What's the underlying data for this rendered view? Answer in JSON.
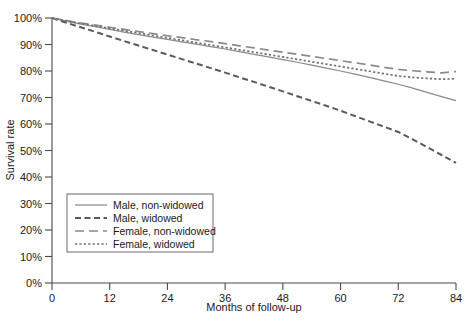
{
  "chart_data": {
    "type": "line",
    "title": "",
    "xlabel": "Months of follow-up",
    "ylabel": "Survival rate",
    "xlim": [
      0,
      84
    ],
    "ylim": [
      0,
      100
    ],
    "grid": false,
    "legend_position": "lower-left",
    "xticks": [
      0,
      12,
      24,
      36,
      48,
      60,
      72,
      84
    ],
    "xtick_labels": [
      "0",
      "12",
      "24",
      "36",
      "48",
      "60",
      "72",
      "84"
    ],
    "yticks": [
      0,
      10,
      20,
      30,
      40,
      50,
      60,
      70,
      80,
      90,
      100
    ],
    "ytick_labels": [
      "0%",
      "10%",
      "20%",
      "30%",
      "40%",
      "50%",
      "60%",
      "70%",
      "80%",
      "90%",
      "100%"
    ],
    "x": [
      0,
      3,
      6,
      9,
      12,
      15,
      18,
      21,
      24,
      27,
      30,
      33,
      36,
      39,
      42,
      45,
      48,
      51,
      54,
      57,
      60,
      63,
      66,
      69,
      72,
      75,
      78,
      81,
      84
    ],
    "series": [
      {
        "name": "Male, non-widowed",
        "style": "solid",
        "color": "#8a8a8a",
        "values": [
          100.0,
          98.8,
          97.7,
          96.7,
          95.7,
          94.7,
          93.7,
          92.8,
          91.9,
          91.0,
          90.1,
          89.2,
          88.3,
          87.3,
          86.3,
          85.3,
          84.3,
          83.3,
          82.2,
          81.1,
          80.0,
          78.8,
          77.6,
          76.3,
          75.0,
          73.5,
          71.9,
          70.3,
          68.8
        ]
      },
      {
        "name": "Male, widowed",
        "style": "dashed",
        "color": "#5a5a5a",
        "values": [
          100.0,
          98.2,
          96.5,
          94.8,
          93.0,
          91.3,
          89.6,
          87.9,
          86.2,
          84.5,
          82.8,
          81.1,
          79.4,
          77.6,
          75.9,
          74.1,
          72.3,
          70.5,
          68.7,
          66.9,
          65.0,
          63.0,
          61.0,
          59.0,
          57.0,
          54.2,
          51.3,
          48.3,
          45.3
        ]
      },
      {
        "name": "Female, non-widowed",
        "style": "longdash",
        "color": "#8a8a8a",
        "values": [
          100.0,
          99.0,
          98.1,
          97.3,
          96.5,
          95.7,
          94.9,
          94.1,
          93.3,
          92.6,
          91.8,
          91.1,
          90.3,
          89.5,
          88.7,
          87.9,
          87.1,
          86.3,
          85.5,
          84.7,
          83.9,
          83.1,
          82.3,
          81.4,
          80.6,
          80.1,
          79.7,
          79.3,
          79.8
        ]
      },
      {
        "name": "Female, widowed",
        "style": "dotted",
        "color": "#6f6f6f",
        "values": [
          100.0,
          98.9,
          97.9,
          97.0,
          96.1,
          95.2,
          94.3,
          93.4,
          92.5,
          91.6,
          90.7,
          89.8,
          88.9,
          88.0,
          87.1,
          86.2,
          85.3,
          84.4,
          83.5,
          82.6,
          81.7,
          80.8,
          79.9,
          79.0,
          78.1,
          77.6,
          77.2,
          76.9,
          77.1
        ]
      }
    ]
  },
  "legend": {
    "items": [
      {
        "label": "Male, non-widowed"
      },
      {
        "label": "Male, widowed"
      },
      {
        "label": "Female, non-widowed"
      },
      {
        "label": "Female, widowed"
      }
    ]
  }
}
